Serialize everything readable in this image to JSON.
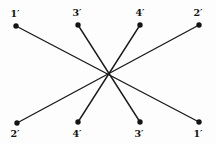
{
  "diagram": {
    "background": "#fdfdfd",
    "stroke_color": "#1a1a1a",
    "dot_color": "#141414",
    "dot_radius": 2.7,
    "line_width": 1.4,
    "center": {
      "x": 108,
      "y": 73
    },
    "points": [
      {
        "id": "t1",
        "label": "1′",
        "x": 16,
        "y": 26,
        "label_x": 15,
        "label_y": 17,
        "row": "top"
      },
      {
        "id": "t3",
        "label": "3′",
        "x": 78,
        "y": 25,
        "label_x": 77,
        "label_y": 16,
        "row": "top"
      },
      {
        "id": "t4",
        "label": "4′",
        "x": 140,
        "y": 25,
        "label_x": 140,
        "label_y": 16,
        "row": "top"
      },
      {
        "id": "t2",
        "label": "2′",
        "x": 199,
        "y": 25,
        "label_x": 198,
        "label_y": 16,
        "row": "top"
      },
      {
        "id": "b2",
        "label": "2′",
        "x": 17,
        "y": 123,
        "label_x": 15,
        "label_y": 137,
        "row": "bottom"
      },
      {
        "id": "b4",
        "label": "4′",
        "x": 78,
        "y": 122,
        "label_x": 77,
        "label_y": 137,
        "row": "bottom"
      },
      {
        "id": "b3",
        "label": "3′",
        "x": 140,
        "y": 122,
        "label_x": 139,
        "label_y": 137,
        "row": "bottom"
      },
      {
        "id": "b1",
        "label": "1′",
        "x": 199,
        "y": 122,
        "label_x": 198,
        "label_y": 137,
        "row": "bottom"
      }
    ],
    "edges": [
      {
        "from": "t1",
        "to": "b1"
      },
      {
        "from": "t2",
        "to": "b2"
      },
      {
        "from": "t3",
        "to": "b3"
      },
      {
        "from": "t4",
        "to": "b4"
      }
    ]
  }
}
